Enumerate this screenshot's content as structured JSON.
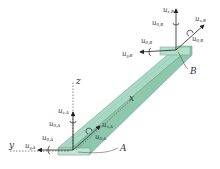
{
  "diagram": {
    "colors": {
      "beam_top": "#a9d8c4",
      "beam_side": "#8cc7ae",
      "beam_end": "#c2e4d4",
      "edge": "#6aa58c",
      "arrow": "#222222",
      "dashed": "#555555"
    },
    "axes": {
      "x": "x",
      "y": "y",
      "z": "z"
    },
    "nodes": {
      "A": "A",
      "B": "B"
    },
    "node_A": {
      "u_x": "u",
      "u_x_sub": "x,A",
      "u_y": "u",
      "u_y_sub": "y,A",
      "u_z": "u",
      "u_z_sub": "z,A",
      "th_x": "u",
      "th_x_sub": "θ,A",
      "th_y": "u",
      "th_y_sub": "θ,A",
      "th_z": "u",
      "th_z_sub": "θ,A"
    },
    "node_B": {
      "u_x": "u",
      "u_x_sub": "x,B",
      "u_y": "u",
      "u_y_sub": "y,B",
      "u_z": "u",
      "u_z_sub": "z,B",
      "th_x": "u",
      "th_x_sub": "θ,B",
      "th_y": "u",
      "th_y_sub": "θ,B",
      "th_z": "u",
      "th_z_sub": "θ,B"
    }
  }
}
